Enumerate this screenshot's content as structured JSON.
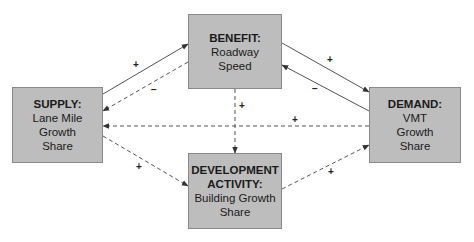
{
  "diagram": {
    "nodes": [
      {
        "id": "benefit",
        "title": "BENEFIT:",
        "lines": [
          "Roadway",
          "Speed"
        ],
        "x": 188,
        "y": 14,
        "w": 94,
        "h": 75
      },
      {
        "id": "supply",
        "title": "SUPPLY:",
        "lines": [
          "Lane Mile",
          "Growth",
          "Share"
        ],
        "x": 12,
        "y": 87,
        "w": 91,
        "h": 76
      },
      {
        "id": "demand",
        "title": "DEMAND:",
        "lines": [
          "VMT",
          "Growth",
          "Share"
        ],
        "x": 369,
        "y": 87,
        "w": 92,
        "h": 76
      },
      {
        "id": "development",
        "title": "DEVELOPMENT ACTIVITY:",
        "title_lines": [
          "DEVELOPMENT",
          "ACTIVITY:"
        ],
        "lines": [
          "Building Growth",
          "Share"
        ],
        "x": 188,
        "y": 153,
        "w": 94,
        "h": 76
      }
    ],
    "edges": [
      {
        "from": "supply",
        "to": "benefit",
        "style": "solid",
        "sign": "+",
        "x1": 103,
        "y1": 94,
        "x2": 188,
        "y2": 44,
        "lx": 136,
        "ly": 65
      },
      {
        "from": "benefit",
        "to": "supply",
        "style": "dashed",
        "sign": "−",
        "x1": 188,
        "y1": 62,
        "x2": 103,
        "y2": 111,
        "lx": 154,
        "ly": 90
      },
      {
        "from": "benefit",
        "to": "demand",
        "style": "solid",
        "sign": "+",
        "x1": 282,
        "y1": 43,
        "x2": 369,
        "y2": 92,
        "lx": 330,
        "ly": 60
      },
      {
        "from": "demand",
        "to": "benefit",
        "style": "solid",
        "sign": "−",
        "x1": 369,
        "y1": 111,
        "x2": 282,
        "y2": 65,
        "lx": 315,
        "ly": 89
      },
      {
        "from": "benefit",
        "to": "development",
        "style": "dashed",
        "sign": "+",
        "x1": 235,
        "y1": 89,
        "x2": 235,
        "y2": 153,
        "lx": 242,
        "ly": 106
      },
      {
        "from": "demand",
        "to": "supply",
        "style": "dashed",
        "sign": "+",
        "x1": 369,
        "y1": 126,
        "x2": 103,
        "y2": 126,
        "lx": 295,
        "ly": 120
      },
      {
        "from": "supply",
        "to": "development",
        "style": "dashed",
        "sign": "+",
        "x1": 103,
        "y1": 136,
        "x2": 188,
        "y2": 186,
        "lx": 139,
        "ly": 167
      },
      {
        "from": "development",
        "to": "demand",
        "style": "dashed",
        "sign": "+",
        "x1": 282,
        "y1": 189,
        "x2": 369,
        "y2": 145,
        "lx": 331,
        "ly": 172
      }
    ],
    "colors": {
      "box_fill": "#bdbdbd",
      "box_border": "#8a8a8a",
      "line": "#555555"
    }
  }
}
